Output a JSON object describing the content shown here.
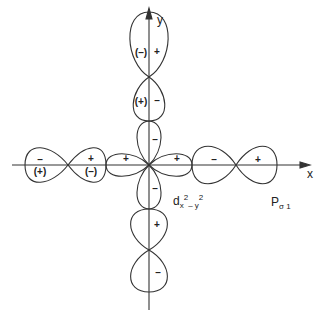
{
  "diagram": {
    "axes": {
      "x_label": "x",
      "y_label": "y"
    },
    "labels": {
      "d_orbital": {
        "base": "d",
        "sub1": "x",
        "sup1": "2",
        "sub2": "– y",
        "sup2": "2"
      },
      "p_orbital": {
        "base": "P",
        "sub": "σ 1"
      }
    },
    "signs": {
      "top_outer_left": "(–)",
      "top_outer_right": "+",
      "top_inner_left": "(+)",
      "top_inner_right": "–",
      "d_up": "–",
      "d_left": "+",
      "d_right": "+",
      "d_down": "–",
      "bottom_inner": "+",
      "bottom_outer": "–",
      "left_outer_top": "–",
      "left_outer_bottom": "(+)",
      "left_inner_top": "+",
      "left_inner_bottom": "(–)",
      "right_inner": "–",
      "right_outer": "+"
    },
    "line_color": "#333333"
  }
}
